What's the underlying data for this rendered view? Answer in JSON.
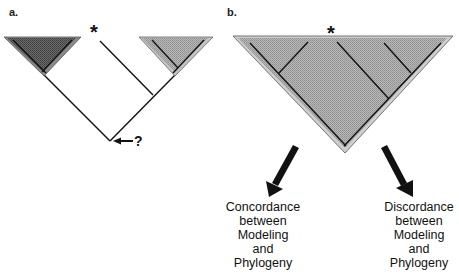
{
  "figure": {
    "panel_a": {
      "label": "a.",
      "asterisk": "*",
      "question_marker": "?",
      "clades": [
        {
          "name": "dark-clade",
          "fill": "#555555"
        },
        {
          "name": "light-clade",
          "fill": "#aaaaaa"
        }
      ]
    },
    "panel_b": {
      "label": "b.",
      "asterisk": "*",
      "triangle_fill": "#a8a8a8",
      "outcomes": [
        {
          "lines": [
            "Concordance",
            "between",
            "Modeling",
            "and",
            "Phylogeny"
          ]
        },
        {
          "lines": [
            "Discordance",
            "between",
            "Modeling",
            "and",
            "Phylogeny"
          ]
        }
      ]
    }
  }
}
